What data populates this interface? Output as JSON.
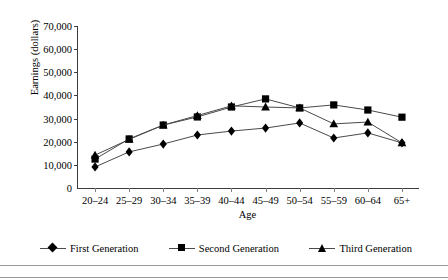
{
  "chart_data": {
    "type": "line",
    "title": "",
    "xlabel": "Age",
    "ylabel": "Earnings (dollars)",
    "categories": [
      "20–24",
      "25–29",
      "30–34",
      "35–39",
      "40–44",
      "45–49",
      "50–54",
      "55–59",
      "60–64",
      "65+"
    ],
    "ylim": [
      0,
      70000
    ],
    "yticks": [
      0,
      10000,
      20000,
      30000,
      40000,
      50000,
      60000,
      70000
    ],
    "ytick_labels": [
      "0",
      "10,000",
      "20,000",
      "30,000",
      "40,000",
      "50,000",
      "60,000",
      "70,000"
    ],
    "grid": false,
    "legend_position": "bottom",
    "series": [
      {
        "name": "First Generation",
        "marker": "diamond",
        "values": [
          9100,
          15600,
          19000,
          22900,
          24600,
          25900,
          28100,
          21600,
          23800,
          19500
        ]
      },
      {
        "name": "Second Generation",
        "marker": "square",
        "values": [
          12500,
          21200,
          27200,
          30700,
          35000,
          38500,
          34600,
          35900,
          33700,
          30600
        ]
      },
      {
        "name": "Third Generation",
        "marker": "triangle",
        "values": [
          14200,
          21000,
          27200,
          31300,
          35500,
          35000,
          34600,
          27700,
          28500,
          19500
        ]
      }
    ]
  },
  "axis": {
    "ylabel": "Earnings (dollars)",
    "xlabel": "Age"
  },
  "legend": {
    "items": [
      {
        "label": "First Generation",
        "marker": "diamond"
      },
      {
        "label": "Second Generation",
        "marker": "square"
      },
      {
        "label": "Third Generation",
        "marker": "triangle"
      }
    ]
  }
}
